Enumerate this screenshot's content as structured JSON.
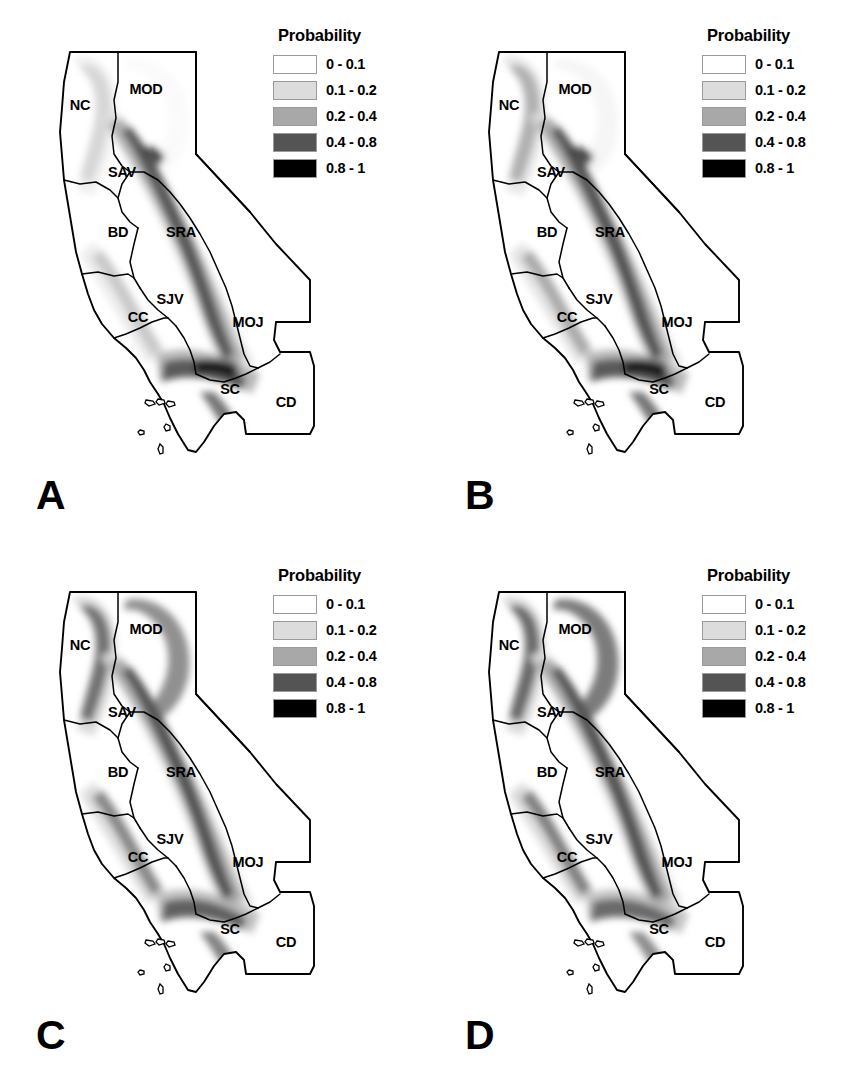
{
  "figure": {
    "type": "multi-panel-map-figure",
    "panel_count": 4,
    "region_name": "California",
    "background": "#ffffff"
  },
  "legend": {
    "title": "Probability",
    "entries": [
      {
        "label": "0 - 0.1",
        "color": "#ffffff",
        "min": 0,
        "max": 0.1
      },
      {
        "label": "0.1 - 0.2",
        "color": "#dcdcdc",
        "min": 0.1,
        "max": 0.2
      },
      {
        "label": "0.2 - 0.4",
        "color": "#a8a8a8",
        "min": 0.2,
        "max": 0.4
      },
      {
        "label": "0.4 - 0.8",
        "color": "#545454",
        "min": 0.4,
        "max": 0.8
      },
      {
        "label": "0.8 - 1",
        "color": "#000000",
        "min": 0.8,
        "max": 1
      }
    ]
  },
  "regions": [
    {
      "code": "NC",
      "x": 62,
      "y": 88
    },
    {
      "code": "MOD",
      "x": 128,
      "y": 72
    },
    {
      "code": "SAV",
      "x": 104,
      "y": 155
    },
    {
      "code": "BD",
      "x": 100,
      "y": 215
    },
    {
      "code": "SRA",
      "x": 163,
      "y": 215
    },
    {
      "code": "SJV",
      "x": 152,
      "y": 282
    },
    {
      "code": "CC",
      "x": 120,
      "y": 300
    },
    {
      "code": "MOJ",
      "x": 230,
      "y": 305
    },
    {
      "code": "SC",
      "x": 212,
      "y": 372
    },
    {
      "code": "CD",
      "x": 268,
      "y": 385
    }
  ],
  "panels": [
    {
      "letter": "A",
      "name": "panel-a",
      "shading": {
        "sierra_opacity": 0.95,
        "coast_opacity": 0.55,
        "north_opacity": 0.4,
        "modoc_opacity": 0.12,
        "transverse_opacity": 1.0,
        "intensity": "low",
        "description": "Narrow high-probability band along Sierra Nevada crest and Transverse Ranges; light stippling in North Coast."
      }
    },
    {
      "letter": "B",
      "name": "panel-b",
      "shading": {
        "sierra_opacity": 1.0,
        "coast_opacity": 0.75,
        "north_opacity": 0.62,
        "modoc_opacity": 0.22,
        "transverse_opacity": 1.0,
        "intensity": "moderate",
        "description": "Wider Sierra Nevada band, stronger North Coast and Coast Range shading than panel A."
      }
    },
    {
      "letter": "C",
      "name": "panel-c",
      "shading": {
        "sierra_opacity": 1.0,
        "coast_opacity": 0.95,
        "north_opacity": 0.95,
        "modoc_opacity": 0.85,
        "transverse_opacity": 0.92,
        "intensity": "high",
        "description": "Extensive shading across North Coast, Modoc Plateau, Sierra Nevada and Coast Ranges."
      }
    },
    {
      "letter": "D",
      "name": "panel-d",
      "shading": {
        "sierra_opacity": 1.0,
        "coast_opacity": 1.0,
        "north_opacity": 1.0,
        "modoc_opacity": 1.0,
        "transverse_opacity": 0.85,
        "intensity": "highest",
        "description": "Broadest shading; most of the North Coast, Modoc, Sierra and Coast Range uplands elevated."
      }
    }
  ]
}
